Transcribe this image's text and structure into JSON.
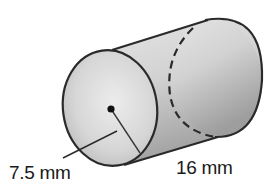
{
  "figure": {
    "shape": "cylinder",
    "labels": {
      "radius": "7.5 mm",
      "height": "16 mm"
    },
    "measurements": {
      "radius_value": 7.5,
      "height_value": 16,
      "unit": "mm"
    },
    "colors": {
      "outline": "#2a2a2a",
      "face_light": "#e6e6e6",
      "face_dark": "#bdbdbd",
      "body_light": "#dcdcdc",
      "body_dark": "#a8a8a8"
    }
  }
}
